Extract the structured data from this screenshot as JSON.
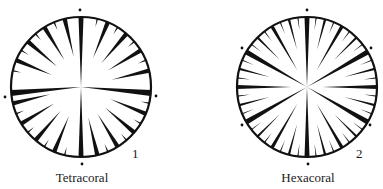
{
  "colors": {
    "ink": "#111111",
    "background": "#ffffff"
  },
  "figures": [
    {
      "id": "tetracoral",
      "caption": "Tetracoral",
      "number": "1",
      "center": [
        81,
        87
      ],
      "radius": 70,
      "dots": [
        [
          80,
          10
        ],
        [
          5,
          97
        ],
        [
          156,
          96
        ],
        [
          82,
          164
        ]
      ],
      "major_septa_deg": [
        0,
        95,
        180,
        265
      ],
      "note": "4 cardinal (protosepta) with septa inserted pinnately in quadrants"
    },
    {
      "id": "hexacoral",
      "caption": "Hexacoral",
      "number": "2",
      "center": [
        307,
        87
      ],
      "radius": 70,
      "dots": [
        [
          307,
          10
        ],
        [
          242,
          48
        ],
        [
          371,
          48
        ],
        [
          242,
          125
        ],
        [
          370,
          125
        ],
        [
          308,
          164
        ]
      ],
      "major_septa_deg": [
        0,
        60,
        90,
        120,
        180,
        240,
        270,
        300
      ],
      "note": "6-fold radial symmetry with cycles of septa"
    }
  ]
}
